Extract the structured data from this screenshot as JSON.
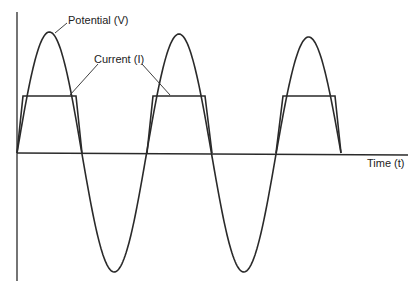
{
  "diagram": {
    "title": "",
    "labels": {
      "potential": "Potential (V)",
      "current": "Current (I)",
      "time_axis": "Time (t)"
    },
    "colors": {
      "line": "#2a2a2a",
      "background": "#ffffff"
    }
  },
  "chart_data": {
    "type": "line",
    "title": "",
    "xlabel": "Time (t)",
    "ylabel": "",
    "series": [
      {
        "name": "Potential (V)",
        "shape": "sine",
        "cycles": 2.5,
        "peaks_relative": [
          1.0,
          0.97,
          0.94
        ],
        "troughs_relative": [
          -1.0,
          -1.0
        ]
      },
      {
        "name": "Current (I)",
        "shape": "trapezoidal pulses (positive half-cycles only)",
        "pulses": 3,
        "plateau_relative": 0.47
      }
    ],
    "grid": false
  }
}
